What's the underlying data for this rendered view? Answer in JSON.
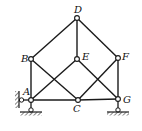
{
  "diagram": {
    "type": "truss",
    "stroke_color": "#1a1a1a",
    "nodes": [
      {
        "id": "D",
        "label": "D",
        "x": 77,
        "y": 18,
        "lx": 74,
        "ly": 13
      },
      {
        "id": "B",
        "label": "B",
        "x": 31,
        "y": 59,
        "lx": 21,
        "ly": 62
      },
      {
        "id": "E",
        "label": "E",
        "x": 77,
        "y": 59,
        "lx": 82,
        "ly": 60
      },
      {
        "id": "F",
        "label": "F",
        "x": 118,
        "y": 58,
        "lx": 122,
        "ly": 60
      },
      {
        "id": "A",
        "label": "A",
        "x": 31,
        "y": 100,
        "lx": 23,
        "ly": 95
      },
      {
        "id": "C",
        "label": "C",
        "x": 78,
        "y": 100,
        "lx": 73,
        "ly": 112
      },
      {
        "id": "G",
        "label": "G",
        "x": 118,
        "y": 99,
        "lx": 123,
        "ly": 103
      }
    ],
    "members": [
      [
        "A",
        "B"
      ],
      [
        "B",
        "D"
      ],
      [
        "D",
        "F"
      ],
      [
        "F",
        "G"
      ],
      [
        "D",
        "E"
      ],
      [
        "A",
        "C"
      ],
      [
        "C",
        "G"
      ],
      [
        "B",
        "C"
      ],
      [
        "A",
        "E"
      ],
      [
        "E",
        "G"
      ],
      [
        "C",
        "F"
      ]
    ],
    "supports": [
      {
        "node": "A",
        "kind": "pin-ground",
        "ground_y": 113
      },
      {
        "node": "A",
        "kind": "wall-link",
        "wall_x": 19
      },
      {
        "node": "G",
        "kind": "pin-ground",
        "ground_y": 113
      }
    ]
  }
}
